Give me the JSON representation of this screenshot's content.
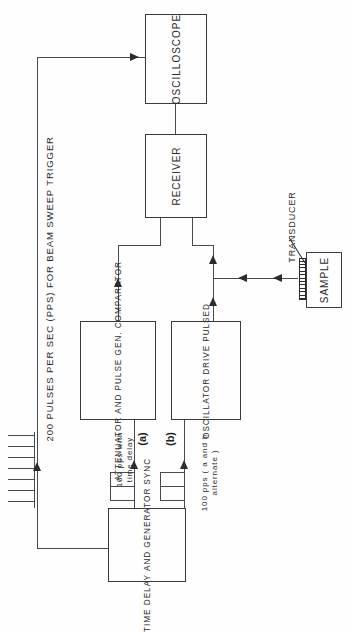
{
  "figure": {
    "title": "200 PULSES PER SEC (PPS) FOR BEAM SWEEP TRIGGER",
    "type": "ultrasonic pulse-echo block diagram",
    "orientation": "rotated 90 degrees counter-clockwise",
    "page_background": "#fefefe",
    "line_color": "#4a4a4a",
    "text_color": "#2b2b2b"
  },
  "blocks": {
    "oscilloscope": {
      "label": "OSCILLOSCOPE"
    },
    "receiver": {
      "label": "RECEIVER"
    },
    "comparator": {
      "line1": "COMPARATOR",
      "line2": "PULSE GEN.",
      "line3": "AND",
      "line4": "ATTENUATOR"
    },
    "pulsed_drive": {
      "line1": "PULSED",
      "line2": "DRIVE",
      "line3": "OSCILLATOR"
    },
    "sync_generator": {
      "line1": "SYNC",
      "line2": "GENERATOR",
      "line3": "AND",
      "line4": "TIME DELAY"
    },
    "sample": {
      "label": "SAMPLE"
    },
    "transducer": {
      "label": "TRANSDUCER"
    }
  },
  "annotations": {
    "signal_a_tag": "(a)",
    "signal_b_tag": "(b)",
    "signal_a_desc_line1": "100 pps with",
    "signal_a_desc_line2": "time delay",
    "signal_b_desc_line1": "100 pps ( a and b",
    "signal_b_desc_line2": "alternate )"
  }
}
